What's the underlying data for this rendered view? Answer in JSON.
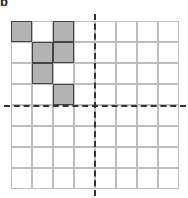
{
  "figure": {
    "label": "b",
    "grid": {
      "rows": 8,
      "cols": 8
    },
    "shaded_cells": [
      {
        "row": 0,
        "col": 0
      },
      {
        "row": 0,
        "col": 2
      },
      {
        "row": 1,
        "col": 1
      },
      {
        "row": 1,
        "col": 2
      },
      {
        "row": 2,
        "col": 1
      },
      {
        "row": 3,
        "col": 2
      }
    ],
    "axes": {
      "vertical_dashed_after_col": 4,
      "horizontal_dashed_after_row": 4
    },
    "colors": {
      "shaded": "#b3b3b3",
      "gridline": "#bdbdbd",
      "axis": "#333333"
    }
  }
}
